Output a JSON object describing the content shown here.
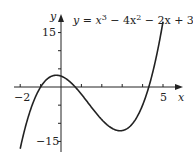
{
  "chart_data": {
    "type": "line",
    "equation": {
      "prefix": "y = x",
      "exp1": "3",
      "mid": " − 4x",
      "exp2": "2",
      "suffix": " − 2x + 3"
    },
    "xlabel": "x",
    "ylabel": "y",
    "x_ticks_labeled": [
      "−2",
      "5"
    ],
    "y_ticks_labeled": [
      "15",
      "−15"
    ],
    "x_tick_values": [
      -2,
      -1,
      0,
      1,
      2,
      3,
      4,
      5
    ],
    "y_tick_values": [
      -15,
      -10,
      -5,
      0,
      5,
      10,
      15
    ],
    "xlim": [
      -2,
      5.3
    ],
    "ylim": [
      -17,
      18
    ],
    "grid": false,
    "legend": "none",
    "series": [
      {
        "name": "y = x^3 - 4x^2 - 2x + 3",
        "x": [
          -2,
          -1.5,
          -1,
          -0.5,
          -0.23,
          0,
          0.5,
          1,
          1.5,
          2,
          2.5,
          2.9,
          3,
          3.5,
          4,
          4.5,
          5,
          5.2
        ],
        "y": [
          -17,
          -7.1,
          0,
          2.9,
          3.24,
          3,
          1.1,
          -2,
          -5.6,
          -9,
          -11.6,
          -12.6,
          -12,
          -11.1,
          -5,
          3.4,
          18,
          17.8
        ]
      }
    ]
  }
}
